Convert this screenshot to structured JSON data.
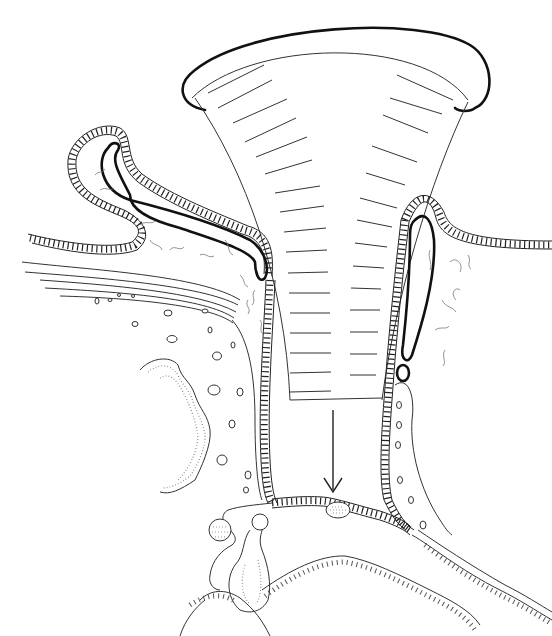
{
  "figure": {
    "type": "biological cross-section line drawing",
    "labels": [],
    "elements": {
      "funnel": "funnel-shaped structure with horizontal striations, capped by a thick rim",
      "arrow": "downward-pointing arrow below the funnel",
      "left_fold": "convoluted epithelial fold with thick inner lining on upper left",
      "right_sac": "elongated sac with thick outline on right side",
      "lower_chamber": "cellular epithelium forming a chamber base with small oval body",
      "bottom_structures": "bulbous glandular structure and ciliated surfaces at bottom"
    },
    "colors": {
      "line": "#222222",
      "background": "#ffffff"
    }
  }
}
